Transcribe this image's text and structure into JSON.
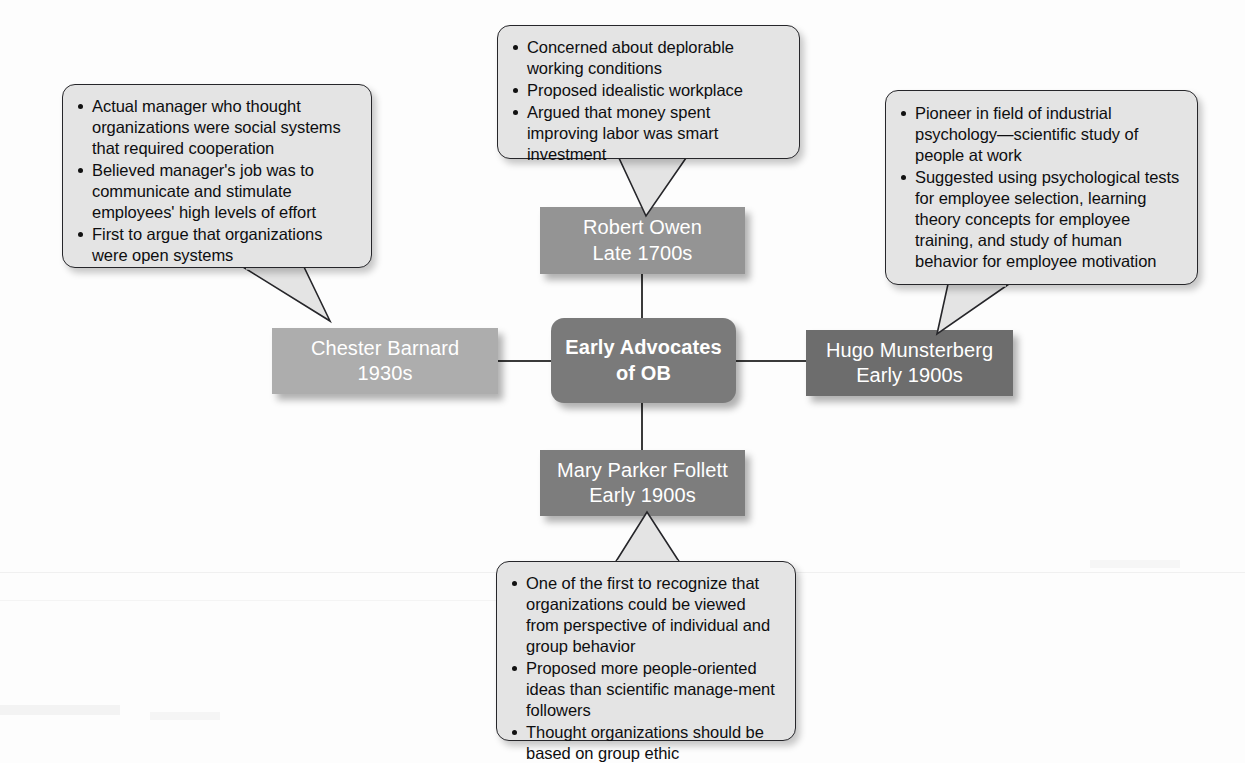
{
  "diagram": {
    "title": "Early Advocates of OB",
    "type": "hub-and-spoke concept map"
  },
  "center": {
    "line1": "Early Advocates",
    "line2": "of OB",
    "color": "#7a7a7a"
  },
  "nodes": {
    "top": {
      "name": "Robert Owen",
      "era": "Late 1700s",
      "color": "#949494"
    },
    "left": {
      "name": "Chester Barnard",
      "era": "1930s",
      "color": "#adadad"
    },
    "right": {
      "name": "Hugo Munsterberg",
      "era": "Early 1900s",
      "color": "#6d6d6d"
    },
    "bottom": {
      "name": "Mary Parker Follett",
      "era": "Early 1900s",
      "color": "#7d7d7d"
    }
  },
  "callouts": {
    "top": {
      "for": "Robert Owen",
      "bullets": [
        "Concerned about deplorable working conditions",
        "Proposed idealistic workplace",
        "Argued that money spent improving labor was smart investment"
      ]
    },
    "left": {
      "for": "Chester Barnard",
      "bullets": [
        "Actual manager who thought organizations were social systems that required cooperation",
        "Believed manager's job was to communicate and stimulate employees' high levels of effort",
        "First to argue that organizations were open systems"
      ]
    },
    "right": {
      "for": "Hugo Munsterberg",
      "bullets": [
        "Pioneer in field of industrial psychology—scientific study of people at work",
        "Suggested using psychological tests for employee selection, learning theory concepts for employee training, and study of human behavior for employee motivation"
      ]
    },
    "bottom": {
      "for": "Mary Parker Follett",
      "bullets": [
        "One of the first to recognize that organizations could be viewed from perspective of individual and group behavior",
        "Proposed more people-oriented ideas than scientific manage-ment followers",
        "Thought organizations should be based on group ethic"
      ]
    }
  }
}
